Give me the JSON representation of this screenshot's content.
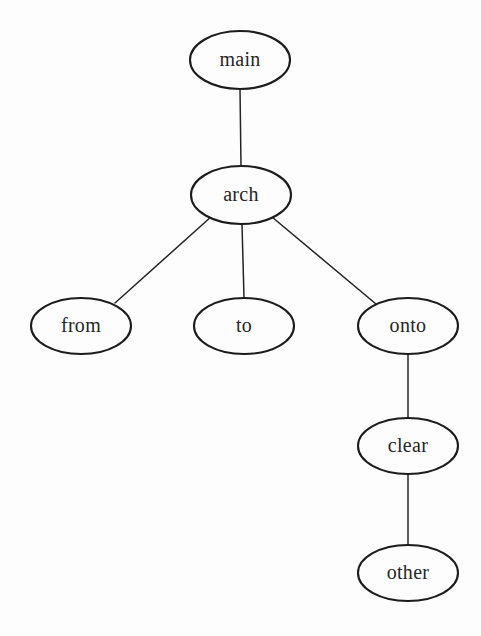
{
  "diagram": {
    "type": "tree",
    "title": "main",
    "background_color": "#fdfdfd",
    "node_stroke_color": "#1c1c1c",
    "edge_stroke_color": "#242424",
    "label_color": "#262626",
    "node_shape": "ellipse",
    "nodes": [
      {
        "id": "main",
        "label": "main",
        "cx": 240,
        "cy": 60,
        "rx": 50,
        "ry": 29,
        "level": 0
      },
      {
        "id": "arch",
        "label": "arch",
        "cx": 241,
        "cy": 195,
        "rx": 50,
        "ry": 29,
        "level": 1
      },
      {
        "id": "from",
        "label": "from",
        "cx": 81,
        "cy": 326,
        "rx": 50,
        "ry": 28,
        "level": 2
      },
      {
        "id": "to",
        "label": "to",
        "cx": 244,
        "cy": 326,
        "rx": 50,
        "ry": 28,
        "level": 2
      },
      {
        "id": "onto",
        "label": "onto",
        "cx": 408,
        "cy": 326,
        "rx": 50,
        "ry": 28,
        "level": 2
      },
      {
        "id": "clear",
        "label": "clear",
        "cx": 408,
        "cy": 446,
        "rx": 50,
        "ry": 28,
        "level": 3
      },
      {
        "id": "other",
        "label": "other",
        "cx": 408,
        "cy": 573,
        "rx": 50,
        "ry": 28,
        "level": 4
      }
    ],
    "edges": [
      {
        "id": "main-arch",
        "from": "main",
        "to": "arch",
        "x1": 240,
        "y1": 89,
        "x2": 241,
        "y2": 166
      },
      {
        "id": "arch-from",
        "from": "arch",
        "to": "from",
        "x1": 212,
        "y1": 216,
        "x2": 115,
        "y2": 303
      },
      {
        "id": "arch-to",
        "from": "arch",
        "to": "to",
        "x1": 242,
        "y1": 224,
        "x2": 244,
        "y2": 298
      },
      {
        "id": "arch-onto",
        "from": "arch",
        "to": "onto",
        "x1": 272,
        "y1": 217,
        "x2": 376,
        "y2": 304
      },
      {
        "id": "onto-clear",
        "from": "onto",
        "to": "clear",
        "x1": 408,
        "y1": 354,
        "x2": 408,
        "y2": 418
      },
      {
        "id": "clear-other",
        "from": "clear",
        "to": "other",
        "x1": 408,
        "y1": 474,
        "x2": 408,
        "y2": 545
      }
    ]
  }
}
